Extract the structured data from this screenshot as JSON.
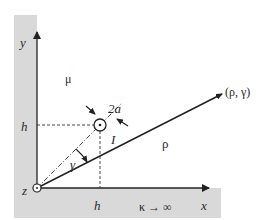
{
  "diagram": {
    "type": "geometry-figure",
    "labels": {
      "y_axis": "y",
      "x_axis": "x",
      "z_axis": "z",
      "mu": "μ",
      "diameter": "2a",
      "current": "I",
      "height_y": "h",
      "height_x": "h",
      "gamma": "γ",
      "rho": "ρ",
      "point": "(ρ, γ)",
      "conductivity": "κ → ∞"
    },
    "colors": {
      "background": "#ffffff",
      "ground_shading": "#d9d9d9",
      "lines": "#222222"
    }
  }
}
